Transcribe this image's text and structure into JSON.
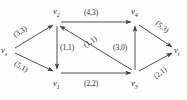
{
  "figure": {
    "type": "flow-network-graph",
    "stroke_color": "#3a3a3a",
    "text_color": "#2b2b2b",
    "background": "#fdfdfd"
  },
  "nodes": [
    {
      "id": "vs",
      "base": "v",
      "sub": "s",
      "x": 8,
      "y": 50
    },
    {
      "id": "v2",
      "base": "v",
      "sub": "2",
      "x": 57,
      "y": 19
    },
    {
      "id": "v4",
      "base": "v",
      "sub": "4",
      "x": 135,
      "y": 19
    },
    {
      "id": "v1",
      "base": "v",
      "sub": "1",
      "x": 57,
      "y": 76
    },
    {
      "id": "v3",
      "base": "v",
      "sub": "3",
      "x": 135,
      "y": 76
    },
    {
      "id": "vt",
      "base": "v",
      "sub": "t",
      "x": 178,
      "y": 50
    }
  ],
  "edges": [
    {
      "id": "vs-v2",
      "from": "vs",
      "to": "v2",
      "label": "(3,3)",
      "capacity": 3,
      "flow": 3
    },
    {
      "id": "vs-v1",
      "from": "vs",
      "to": "v1",
      "label": "(5,1)",
      "capacity": 5,
      "flow": 1
    },
    {
      "id": "v2-v1",
      "from": "v2",
      "to": "v1",
      "label": "(1,1)",
      "capacity": 1,
      "flow": 1
    },
    {
      "id": "v2-v4",
      "from": "v2",
      "to": "v4",
      "label": "(4,3)",
      "capacity": 4,
      "flow": 3
    },
    {
      "id": "v3-v2",
      "from": "v3",
      "to": "v2",
      "label": "(1,1)",
      "capacity": 1,
      "flow": 1
    },
    {
      "id": "v1-v3",
      "from": "v1",
      "to": "v3",
      "label": "(2,2)",
      "capacity": 2,
      "flow": 2
    },
    {
      "id": "v3-v4",
      "from": "v3",
      "to": "v4",
      "label": "(3,0)",
      "capacity": 3,
      "flow": 0
    },
    {
      "id": "v4-vt",
      "from": "v4",
      "to": "vt",
      "label": "(5,3)",
      "capacity": 5,
      "flow": 3
    },
    {
      "id": "v3-vt",
      "from": "v3",
      "to": "vt",
      "label": "(2,1)",
      "capacity": 2,
      "flow": 1
    }
  ],
  "labels": {
    "node_vs": "v",
    "node_vs_sub": "s",
    "node_v1": "v",
    "node_v1_sub": "1",
    "node_v2": "v",
    "node_v2_sub": "2",
    "node_v3": "v",
    "node_v3_sub": "3",
    "node_v4": "v",
    "node_v4_sub": "4",
    "node_vt": "v",
    "node_vt_sub": "t",
    "edge_vs_v2": "(3,3)",
    "edge_vs_v1": "(5,1)",
    "edge_v2_v1": "(1,1)",
    "edge_v2_v4": "(4,3)",
    "edge_v3_v2": "(1,1)",
    "edge_v1_v3": "(2,2)",
    "edge_v3_v4": "(3,0)",
    "edge_v4_vt": "(5,3)",
    "edge_v3_vt": "(2,1)"
  }
}
